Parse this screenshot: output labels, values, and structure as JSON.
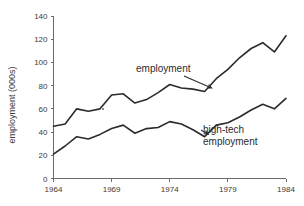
{
  "chart_data": {
    "type": "line",
    "title": "",
    "xlabel": "",
    "ylabel": "employment (000s)",
    "xlim": [
      1964,
      1984
    ],
    "ylim": [
      0,
      140
    ],
    "grid": false,
    "legend_position": "inline-annotations",
    "xticks": [
      "1964",
      "1969",
      "1974",
      "1979",
      "1984"
    ],
    "xtick_values": [
      1964,
      1969,
      1974,
      1979,
      1984
    ],
    "yticks": [
      "0",
      "20",
      "40",
      "60",
      "80",
      "100",
      "120",
      "140"
    ],
    "ytick_values": [
      0,
      20,
      40,
      60,
      80,
      100,
      120,
      140
    ],
    "x": [
      1964,
      1965,
      1966,
      1967,
      1968,
      1969,
      1970,
      1971,
      1972,
      1973,
      1974,
      1975,
      1976,
      1977,
      1978,
      1979,
      1980,
      1981,
      1982,
      1983,
      1984
    ],
    "series": [
      {
        "name": "employment",
        "color": "#2b2b2b",
        "values": [
          45,
          47,
          60,
          58,
          60,
          72,
          73,
          65,
          68,
          74,
          81,
          78,
          77,
          75,
          86,
          94,
          104,
          112,
          117,
          109,
          123
        ]
      },
      {
        "name": "high-tech employment",
        "color": "#2b2b2b",
        "values": [
          21,
          28,
          36,
          34,
          38,
          43,
          46,
          39,
          43,
          44,
          49,
          47,
          42,
          36,
          46,
          48,
          53,
          59,
          64,
          60,
          69
        ]
      }
    ],
    "annotations": [
      {
        "name": "employment",
        "text": "employment",
        "target_year": 1977.6,
        "target_value": 78
      },
      {
        "name": "high-tech-employment",
        "text_line1": "high-tech",
        "text_line2": "employment",
        "target_year": 1977.3,
        "target_value": 38
      }
    ]
  },
  "figure": {
    "background": "#ffffff",
    "axis_color": "#6b6b6b",
    "line_color": "#2b2b2b",
    "text_color": "#3a3a3a"
  }
}
